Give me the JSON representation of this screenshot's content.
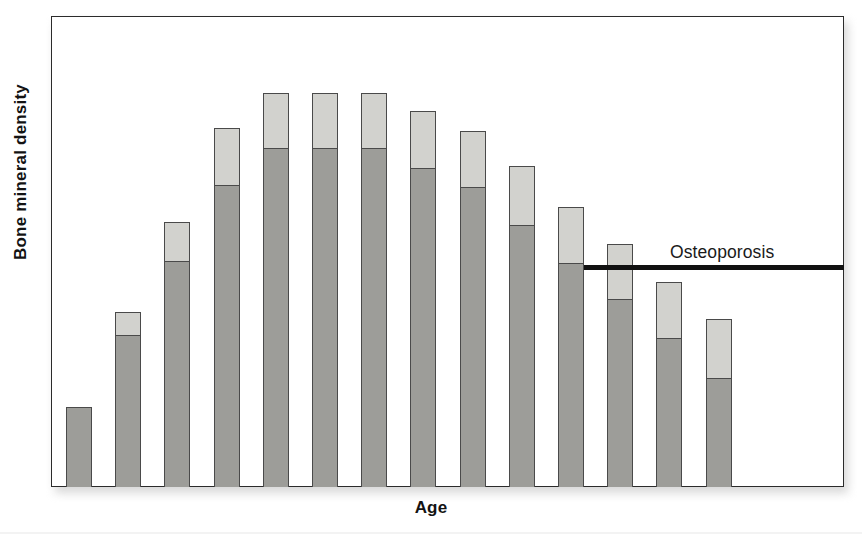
{
  "chart_data": {
    "type": "bar",
    "title": "",
    "subtitle": "",
    "xlabel": "Age",
    "ylabel": "Bone mineral density",
    "grid": false,
    "legend_position": "none",
    "stacked": true,
    "axis_tick_labels": {
      "x": [],
      "y": []
    },
    "categories": [
      "1",
      "2",
      "3",
      "4",
      "5",
      "6",
      "7",
      "8",
      "9",
      "10",
      "11",
      "12",
      "13",
      "14"
    ],
    "series": [
      {
        "name": "lower segment",
        "color": "#9d9d99",
        "values": [
          80,
          152,
          226,
          302,
          339,
          339,
          339,
          319,
          300,
          262,
          224,
          188,
          149,
          109
        ]
      },
      {
        "name": "upper segment",
        "color": "#d2d2ce",
        "values": [
          0,
          23,
          39,
          57,
          55,
          55,
          55,
          57,
          56,
          59,
          56,
          55,
          56,
          59
        ]
      }
    ],
    "totals": [
      80,
      175,
      265,
      359,
      394,
      394,
      394,
      376,
      356,
      321,
      280,
      243,
      205,
      168
    ],
    "ylim": [
      0,
      471
    ],
    "annotations": [
      {
        "label": "Osteoporosis",
        "type": "threshold-line",
        "value": 220,
        "line_color": "#111111",
        "starts_at_category": 11,
        "extends_to": "right-axis"
      }
    ]
  },
  "axes": {
    "y_title": "Bone mineral density",
    "x_title": "Age"
  },
  "colors": {
    "bar_lower": "#9d9d99",
    "bar_upper": "#d2d2ce",
    "bar_outline": "#4a4a4a",
    "frame": "#2b2b2b",
    "threshold": "#111111",
    "background": "#ffffff"
  },
  "annotation": {
    "osteoporosis_label": "Osteoporosis"
  }
}
